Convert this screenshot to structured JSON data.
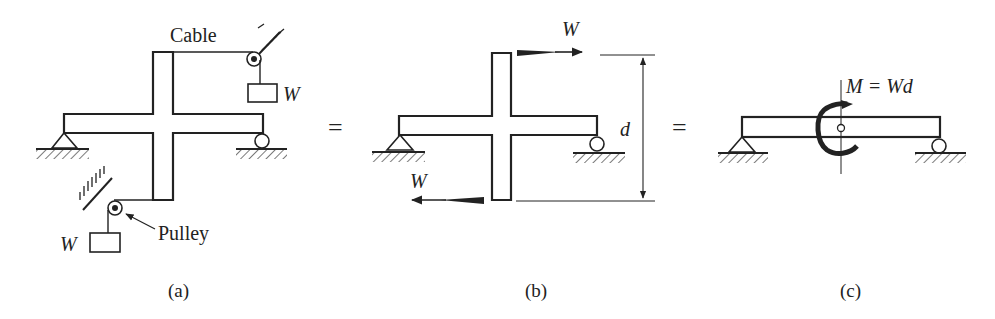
{
  "figure": {
    "panels": [
      {
        "id": "a",
        "caption": "(a)",
        "labels": {
          "cable": "Cable",
          "pulley": "Pulley",
          "weight_top": "W",
          "weight_bottom": "W"
        }
      },
      {
        "id": "b",
        "caption": "(b)",
        "labels": {
          "force_top": "W",
          "force_bottom": "W",
          "distance": "d"
        }
      },
      {
        "id": "c",
        "caption": "(c)",
        "labels": {
          "moment": "M = Wd"
        }
      }
    ],
    "equals_1": "=",
    "equals_2": "=",
    "colors": {
      "ink": "#222222",
      "background": "#ffffff"
    }
  }
}
